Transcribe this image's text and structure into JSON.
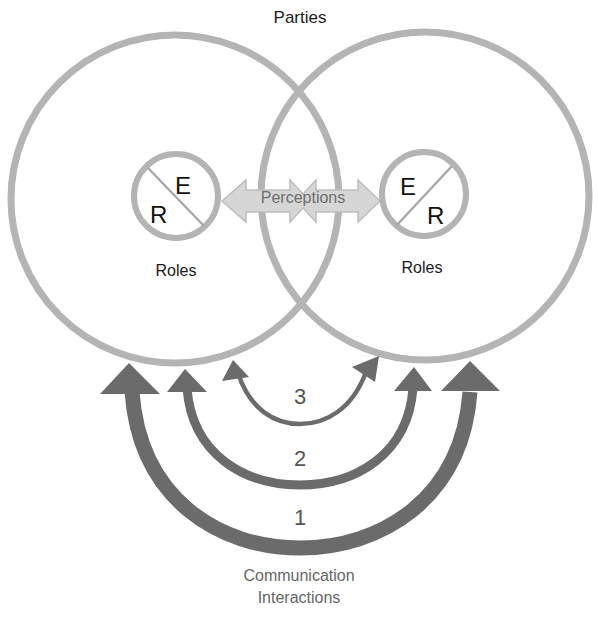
{
  "diagram": {
    "title": "Parties",
    "colors": {
      "circle_stroke": "#b4b4b4",
      "arrow_fill": "#6b6b6b",
      "perception_fill": "#d6d6d6",
      "perception_stroke": "#bdbdbd",
      "text": "#1a1a1a",
      "muted_text": "#666666"
    },
    "parties": [
      {
        "id": "left-party",
        "role_circle": {
          "top_letter": "E",
          "bottom_letter": "R",
          "label": "Roles"
        }
      },
      {
        "id": "right-party",
        "role_circle": {
          "top_letter": "E",
          "bottom_letter": "R",
          "label": "Roles"
        }
      }
    ],
    "perceptions": {
      "label": "Perceptions",
      "icon": "double-headed-arrow"
    },
    "interactions": [
      {
        "level": "1",
        "weight": "thick"
      },
      {
        "level": "2",
        "weight": "medium"
      },
      {
        "level": "3",
        "weight": "thin"
      }
    ],
    "footer": {
      "line1": "Communication",
      "line2": "Interactions"
    }
  }
}
